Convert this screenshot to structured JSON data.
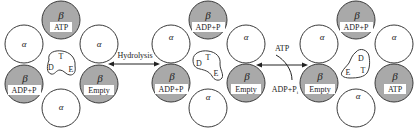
{
  "diagram": {
    "complexes": [
      {
        "id": "state-1",
        "cx": 61,
        "beta_top": {
          "greek": "β",
          "label": "ATP"
        },
        "beta_left": {
          "greek": "β",
          "label": "ADP+P"
        },
        "beta_right": {
          "greek": "β",
          "label": "Empty"
        },
        "alpha_label": "α",
        "shaft": {
          "t": "T",
          "d": "D",
          "e": "E"
        }
      },
      {
        "id": "state-2",
        "cx": 208,
        "beta_top": {
          "greek": "β",
          "label": "ADP+P"
        },
        "beta_left": {
          "greek": "β",
          "label": "ADP+P"
        },
        "beta_right": {
          "greek": "β",
          "label": "Empty"
        },
        "alpha_label": "α",
        "shaft": {
          "t": "T",
          "d": "D",
          "e": "E"
        }
      },
      {
        "id": "state-3",
        "cx": 356,
        "beta_top": {
          "greek": "β",
          "label": "ADP+P"
        },
        "beta_left": {
          "greek": "β",
          "label": "Empty"
        },
        "beta_right": {
          "greek": "β",
          "label": "ATP"
        },
        "alpha_label": "α",
        "shaft": {
          "t": "T",
          "d": "D",
          "e": "E"
        }
      }
    ],
    "arrows": {
      "hydrolysis": {
        "label": "Hydrolysis"
      },
      "exchange": {
        "in_label": "ATP",
        "out_label": "ADP+P",
        "out_sub": "i"
      }
    },
    "colors": {
      "beta_fill": "#a9a9a9",
      "alpha_fill": "#ffffff",
      "stroke": "#3a3a3a"
    }
  }
}
